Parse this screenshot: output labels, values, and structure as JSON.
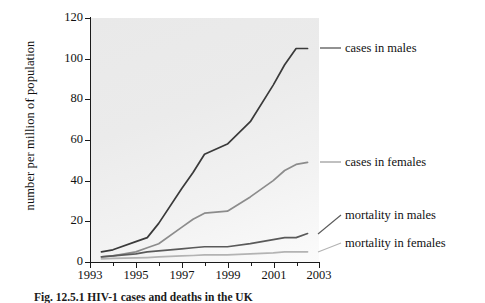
{
  "chart_data": {
    "type": "line",
    "title": "",
    "xlabel": "",
    "ylabel": "number per million of population",
    "xlim": [
      1993,
      2003
    ],
    "ylim": [
      0,
      120
    ],
    "grid": false,
    "legend_position": "right-inline-labels",
    "x_ticks": [
      "1993",
      "1995",
      "1997",
      "1999",
      "2001",
      "2003"
    ],
    "y_ticks": [
      "0",
      "20",
      "40",
      "60",
      "80",
      "100",
      "120"
    ],
    "x": [
      1993.5,
      1994,
      1995,
      1995.5,
      1996,
      1997,
      1997.5,
      1998,
      1999,
      2000,
      2001,
      2001.5,
      2002,
      2002.5
    ],
    "series": [
      {
        "name": "cases in males",
        "color": "#3a3a3a",
        "values": [
          5,
          6,
          10,
          12,
          19,
          36,
          44,
          53,
          58,
          69,
          87,
          97,
          105,
          105
        ]
      },
      {
        "name": "cases in females",
        "color": "#8c8c8c",
        "values": [
          2.5,
          3,
          5,
          7,
          9,
          17,
          21,
          24,
          25,
          32,
          40,
          45,
          48,
          49
        ]
      },
      {
        "name": "mortality in males",
        "color": "#5a5a5a",
        "values": [
          2.5,
          3,
          4,
          5,
          5.5,
          6.5,
          7,
          7.5,
          7.5,
          9,
          11,
          12,
          12,
          14
        ]
      },
      {
        "name": "mortality in females",
        "color": "#b3b3b3",
        "values": [
          1.5,
          1.8,
          2,
          2.2,
          2.5,
          3,
          3.2,
          3.5,
          3.5,
          4,
          4.5,
          5,
          5,
          5
        ]
      }
    ]
  },
  "legend": {
    "items": [
      {
        "label": "cases in males"
      },
      {
        "label": "cases in females"
      },
      {
        "label": "mortality in males"
      },
      {
        "label": "mortality in females"
      }
    ]
  },
  "caption": {
    "text": "Fig. 12.5.1 HIV-1 cases and deaths in the UK"
  },
  "colors": {
    "cases_males": "#3a3a3a",
    "cases_females": "#8c8c8c",
    "mortality_males": "#5a5a5a",
    "mortality_females": "#b3b3b3",
    "axis": "#1a1a1a",
    "plot_background": "#ededed"
  }
}
